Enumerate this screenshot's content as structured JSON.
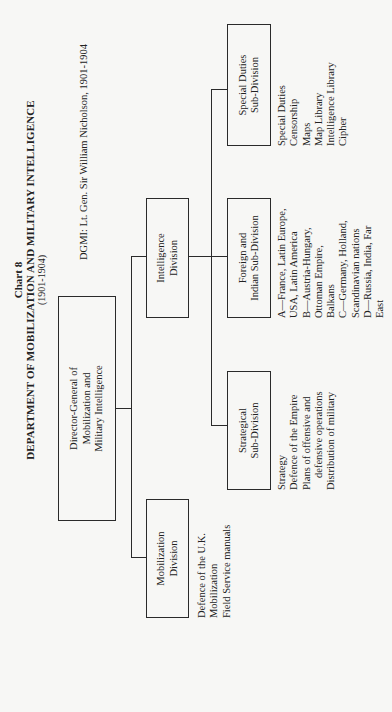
{
  "header": {
    "chart_number": "Chart 8",
    "title": "DEPARTMENT OF MOBILIZATION AND MILITARY INTELLIGENCE",
    "years": "(1901-1904)",
    "dgmi": "DGMI:  Lt. Gen. Sir William Nicholson, 1901-1904"
  },
  "orientation": "rotated 90° counter-clockwise",
  "org": {
    "director": {
      "label_lines": [
        "Director-General of",
        "Mobilization and",
        "Military Intelligence"
      ]
    },
    "divisions": [
      {
        "id": "mobilization",
        "label_lines": [
          "Mobilization",
          "Division"
        ],
        "duties": [
          "Defence of the U.K.",
          "Mobilization",
          "Field Service manuals"
        ]
      },
      {
        "id": "intelligence",
        "label_lines": [
          "Intelligence",
          "Division"
        ],
        "subdivisions": [
          {
            "id": "strategical",
            "label_lines": [
              "Strategical",
              "Sub-Division"
            ],
            "duties": [
              "Strategy",
              "Defence of the Empire",
              "Plans of offensive and",
              "defensive operations",
              "Distribution of military"
            ]
          },
          {
            "id": "foreign-indian",
            "label_lines": [
              "Foreign and",
              "Indian Sub-Division"
            ],
            "duties": [
              "A—France, Latin Europe,",
              "USA, Latin America",
              "B—Austria-Hungary,",
              "Ottoman Empire,",
              "Balkans",
              "C—Germany, Holland,",
              "Scandinavian nations",
              "D—Russia, India, Far",
              "East"
            ]
          },
          {
            "id": "special-duties",
            "label_lines": [
              "Special Duties",
              "Sub-Division"
            ],
            "duties": [
              "Special Duties",
              "Censorship",
              "Maps",
              "Map Library",
              "Intelligence Library",
              "Cipher"
            ]
          }
        ]
      }
    ]
  }
}
